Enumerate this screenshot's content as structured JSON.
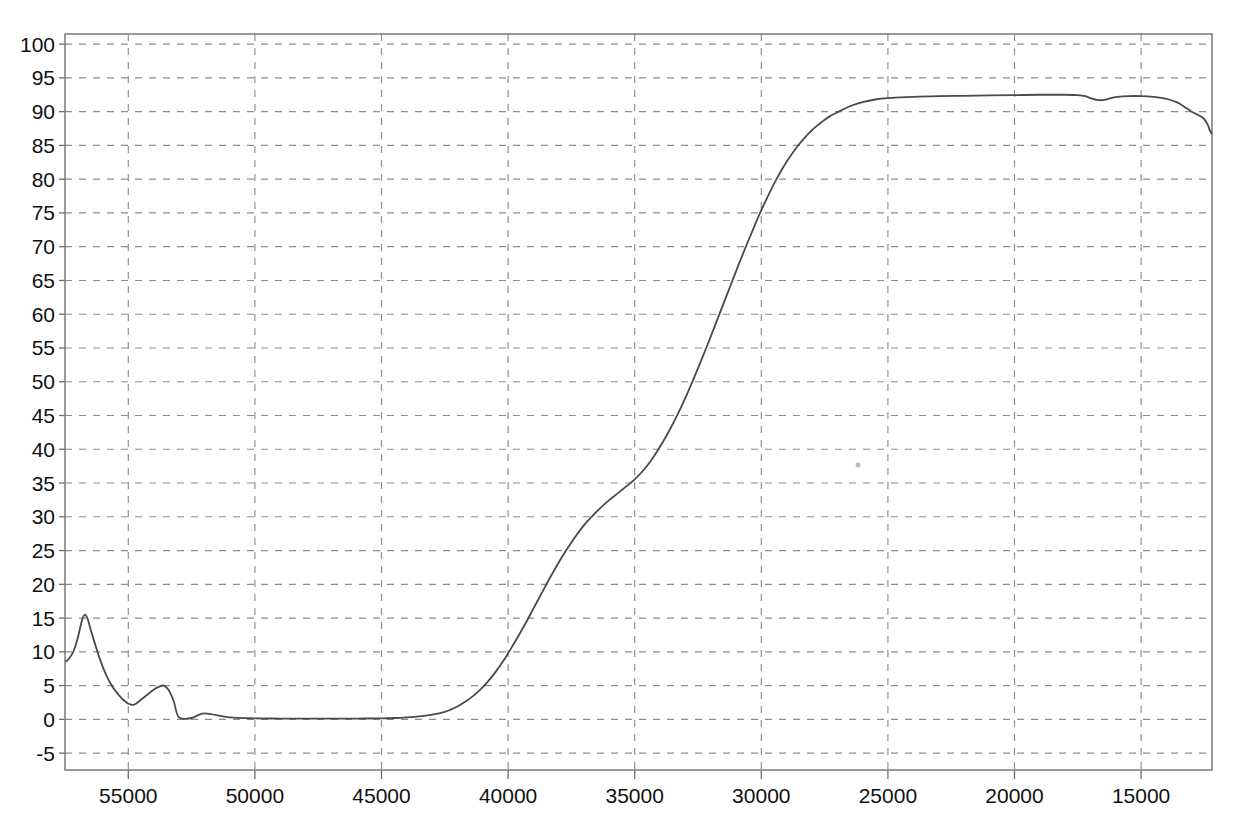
{
  "chart_data": {
    "type": "line",
    "title": "",
    "subtitle": "",
    "xlabel": "",
    "ylabel": "",
    "xlim": [
      57500,
      12200
    ],
    "ylim": [
      -7.5,
      101.5
    ],
    "x_inverted": true,
    "grid": true,
    "legend": "none",
    "x_ticks": [
      55000,
      50000,
      45000,
      40000,
      35000,
      30000,
      25000,
      20000,
      15000
    ],
    "x_tick_labels": [
      "55000",
      "50000",
      "45000",
      "40000",
      "35000",
      "30000",
      "25000",
      "20000",
      "15000"
    ],
    "y_ticks": [
      -5,
      0,
      5,
      10,
      15,
      20,
      25,
      30,
      35,
      40,
      45,
      50,
      55,
      60,
      65,
      70,
      75,
      80,
      85,
      90,
      95,
      100
    ],
    "y_tick_labels": [
      "-5",
      "0",
      "5",
      "10",
      "15",
      "20",
      "25",
      "30",
      "35",
      "40",
      "45",
      "50",
      "55",
      "60",
      "65",
      "70",
      "75",
      "80",
      "85",
      "90",
      "95",
      "100"
    ],
    "series": [
      {
        "name": "transmittance",
        "color": "#4a4a4a",
        "x": [
          57450,
          57300,
          57150,
          57000,
          56900,
          56800,
          56700,
          56600,
          56500,
          56400,
          56300,
          56200,
          56100,
          56000,
          55900,
          55800,
          55700,
          55600,
          55500,
          55400,
          55300,
          55200,
          55100,
          55000,
          54900,
          54800,
          54700,
          54600,
          54500,
          54400,
          54300,
          54200,
          54100,
          54000,
          53800,
          53600,
          53400,
          53200,
          53000,
          52500,
          52000,
          51000,
          50000,
          49000,
          48000,
          47000,
          46000,
          45000,
          44500,
          44000,
          43500,
          43000,
          42600,
          42300,
          42000,
          41700,
          41400,
          41100,
          40800,
          40500,
          40200,
          39900,
          39600,
          39300,
          39000,
          38700,
          38400,
          38100,
          37800,
          37500,
          37200,
          36900,
          36600,
          36300,
          36000,
          35700,
          35400,
          35100,
          34800,
          34500,
          34200,
          33900,
          33600,
          33300,
          33000,
          32700,
          32400,
          32100,
          31800,
          31500,
          31200,
          30900,
          30600,
          30300,
          30000,
          29700,
          29400,
          29100,
          28800,
          28500,
          28200,
          27900,
          27600,
          27300,
          27000,
          26500,
          26000,
          25500,
          25000,
          24000,
          23000,
          22000,
          21000,
          20000,
          19000,
          18000,
          17500,
          17200,
          17000,
          16800,
          16600,
          16400,
          16200,
          16000,
          15500,
          15000,
          14500,
          14200,
          13900,
          13600,
          13400,
          13200,
          13000,
          12800,
          12600,
          12450,
          12350,
          12280,
          12220
        ],
        "y": [
          8.6,
          9.2,
          10.2,
          12.0,
          13.6,
          15.0,
          15.5,
          14.8,
          13.5,
          12.2,
          11.0,
          9.8,
          8.7,
          7.7,
          6.8,
          6.0,
          5.3,
          4.7,
          4.2,
          3.7,
          3.3,
          2.9,
          2.6,
          2.3,
          2.2,
          2.15,
          2.3,
          2.6,
          2.9,
          3.2,
          3.5,
          3.8,
          4.1,
          4.4,
          4.8,
          5.0,
          4.3,
          2.6,
          0.3,
          0.2,
          0.9,
          0.3,
          0.15,
          0.12,
          0.1,
          0.1,
          0.12,
          0.15,
          0.2,
          0.3,
          0.45,
          0.7,
          1.0,
          1.4,
          1.9,
          2.6,
          3.4,
          4.4,
          5.6,
          7.0,
          8.6,
          10.4,
          12.3,
          14.3,
          16.4,
          18.5,
          20.6,
          22.6,
          24.5,
          26.2,
          27.8,
          29.2,
          30.4,
          31.5,
          32.5,
          33.4,
          34.3,
          35.2,
          36.3,
          37.6,
          39.2,
          41.0,
          43.0,
          45.2,
          47.6,
          50.2,
          52.9,
          55.7,
          58.6,
          61.5,
          64.4,
          67.3,
          70.1,
          72.8,
          75.4,
          77.8,
          80.0,
          82.0,
          83.7,
          85.2,
          86.5,
          87.6,
          88.5,
          89.3,
          89.9,
          90.8,
          91.4,
          91.8,
          92.0,
          92.2,
          92.3,
          92.35,
          92.4,
          92.45,
          92.5,
          92.5,
          92.45,
          92.3,
          92.0,
          91.8,
          91.7,
          91.8,
          92.0,
          92.15,
          92.3,
          92.3,
          92.2,
          92.05,
          91.8,
          91.4,
          91.0,
          90.5,
          90.0,
          89.6,
          89.2,
          88.6,
          87.9,
          87.2,
          86.8
        ]
      }
    ],
    "annotations": [
      {
        "type": "speck",
        "x_px": 858,
        "y_px": 465,
        "size_px": 2.4
      }
    ],
    "colors": {
      "curve": "#4a4a4a",
      "grid": "#8d8d8d",
      "frame": "#7a7a7a",
      "text": "#101010",
      "background": "#ffffff"
    },
    "plot_area_px": {
      "left": 65,
      "right": 1212,
      "top": 34,
      "bottom": 770
    }
  }
}
